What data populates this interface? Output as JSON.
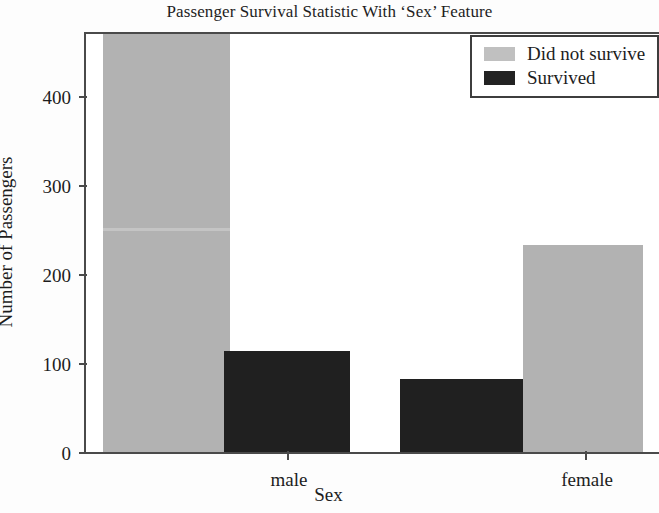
{
  "chart_data": {
    "type": "bar",
    "title": "Passenger Survival Statistic With ‘Sex’ Feature",
    "xlabel": "Sex",
    "ylabel": "Number of Passengers",
    "categories": [
      "male",
      "female"
    ],
    "series": [
      {
        "name": "Did not survive",
        "color": "#b2b2b2",
        "values": [
          470,
          233
        ]
      },
      {
        "name": "Survived",
        "color": "#202020",
        "values": [
          114,
          82
        ]
      }
    ],
    "ylim": [
      0,
      470
    ],
    "yticks": [
      0,
      100,
      200,
      300,
      400
    ],
    "ytick_labels": [
      "0",
      "100",
      "200",
      "300",
      "400"
    ],
    "grid": false,
    "legend_position": "top-right",
    "bar_order_male": [
      "Did not survive",
      "Survived"
    ],
    "bar_order_female": [
      "Survived",
      "Did not survive"
    ]
  },
  "legend": {
    "entries": [
      {
        "label": "Did not survive",
        "swatch": "gray"
      },
      {
        "label": "Survived",
        "swatch": "dark"
      }
    ]
  },
  "axes": {
    "y_tick_labels": [
      "400",
      "300",
      "200",
      "100",
      "0"
    ],
    "x_tick_labels": [
      "male",
      "female"
    ]
  }
}
